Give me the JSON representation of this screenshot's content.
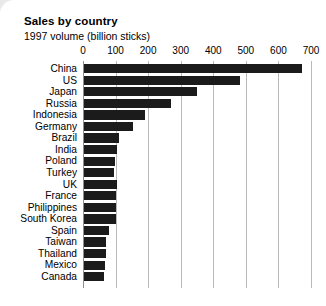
{
  "card": {
    "background_color": "#ffffff",
    "page_background_color": "#e9e9e9"
  },
  "chart_data": {
    "type": "bar",
    "orientation": "horizontal",
    "title": "Sales by country",
    "subtitle": "1997 volume (billion sticks)",
    "xlabel": "",
    "ylabel": "",
    "xlim": [
      0,
      700
    ],
    "ticks": [
      0,
      100,
      200,
      300,
      400,
      500,
      600,
      700
    ],
    "tick_labels": [
      "0",
      "100",
      "200",
      "300",
      "400",
      "500",
      "600",
      "700"
    ],
    "grid": true,
    "grid_axis": "x",
    "legend": false,
    "bar_color": "#1b1b1b",
    "grid_color": "#b9b9b9",
    "categories": [
      "China",
      "US",
      "Japan",
      "Russia",
      "Indonesia",
      "Germany",
      "Brazil",
      "India",
      "Poland",
      "Turkey",
      "UK",
      "France",
      "Philippines",
      "South Korea",
      "Spain",
      "Taiwan",
      "Thailand",
      "Mexico",
      "Canada"
    ],
    "values": [
      668,
      480,
      347,
      267,
      187,
      150,
      108,
      100,
      95,
      93,
      100,
      98,
      98,
      97,
      78,
      68,
      68,
      65,
      62
    ]
  }
}
